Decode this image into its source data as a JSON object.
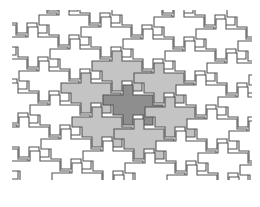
{
  "diagram": {
    "type": "polyomino-tessellation",
    "colors": {
      "background": "#ffffff",
      "stroke": "#555555",
      "tile_default": "#ffffff",
      "tile_neighbor": "#c4c4c4",
      "tile_center": "#8e8e8e"
    },
    "tile_shape": [
      [
        0,
        0
      ],
      [
        10,
        0
      ],
      [
        10,
        -10
      ],
      [
        20,
        -10
      ],
      [
        20,
        0
      ],
      [
        40,
        0
      ],
      [
        40,
        10
      ],
      [
        50,
        10
      ],
      [
        50,
        20
      ],
      [
        40,
        20
      ],
      [
        40,
        30
      ],
      [
        30,
        30
      ],
      [
        30,
        20
      ],
      [
        20,
        20
      ],
      [
        20,
        30
      ],
      [
        10,
        30
      ],
      [
        10,
        20
      ],
      [
        0,
        20
      ],
      [
        0,
        10
      ],
      [
        -10,
        10
      ],
      [
        -10,
        0
      ]
    ],
    "lattice": {
      "a": [
        42,
        12
      ],
      "b": [
        31,
        -22
      ],
      "origin": [
        113,
        95
      ]
    },
    "highlight": {
      "center": [
        0,
        0
      ],
      "neighbors": [
        [
          -1,
          0
        ],
        [
          1,
          0
        ],
        [
          0,
          -1
        ],
        [
          0,
          1
        ],
        [
          -1,
          1
        ],
        [
          1,
          -1
        ]
      ]
    }
  }
}
